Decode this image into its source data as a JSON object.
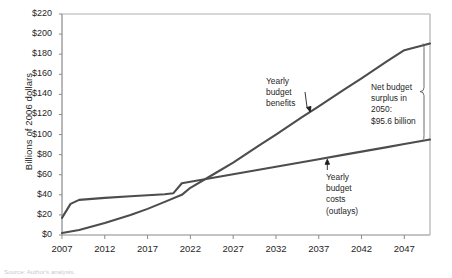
{
  "figure": {
    "source_note": "Source: Author's analysis."
  },
  "chart_data": {
    "type": "line",
    "title": "",
    "xlabel": "",
    "ylabel": "Billions of 2006 dollars",
    "xlim": [
      2007,
      2050
    ],
    "ylim": [
      0,
      220
    ],
    "grid": false,
    "legend": "none (inline annotations)",
    "xticks": [
      "2007",
      "2012",
      "2017",
      "2022",
      "2027",
      "2032",
      "2037",
      "2042",
      "2047"
    ],
    "xtick_values": [
      2007,
      2012,
      2017,
      2022,
      2027,
      2032,
      2037,
      2042,
      2047
    ],
    "yticks": [
      "$0",
      "$20",
      "$40",
      "$60",
      "$80",
      "$100",
      "$120",
      "$140",
      "$160",
      "$180",
      "$200",
      "$220"
    ],
    "ytick_values": [
      0,
      20,
      40,
      60,
      80,
      100,
      120,
      140,
      160,
      180,
      200,
      220
    ],
    "series": [
      {
        "name": "Yearly budget benefits",
        "color": "#4d4d4d",
        "x": [
          2007,
          2009,
          2012,
          2015,
          2017,
          2019,
          2021,
          2022,
          2025,
          2027,
          2030,
          2032,
          2035,
          2037,
          2040,
          2042,
          2045,
          2047,
          2050
        ],
        "values": [
          2.0,
          5.0,
          12.0,
          20.0,
          26.0,
          33.0,
          40.0,
          47.0,
          62.0,
          72.0,
          89.0,
          100.0,
          117.0,
          128.0,
          145.0,
          156.0,
          173.0,
          184.0,
          190.6
        ]
      },
      {
        "name": "Yearly budget costs (outlays)",
        "color": "#4d4d4d",
        "x": [
          2007,
          2008,
          2009,
          2012,
          2015,
          2017,
          2019,
          2020,
          2021,
          2022,
          2025,
          2027,
          2030,
          2032,
          2035,
          2037,
          2040,
          2042,
          2045,
          2047,
          2050
        ],
        "values": [
          17.0,
          31.0,
          35.0,
          37.0,
          38.5,
          39.5,
          40.5,
          41.5,
          51.5,
          53.0,
          57.5,
          60.5,
          65.0,
          68.0,
          72.5,
          75.5,
          80.0,
          83.0,
          87.5,
          90.5,
          95.0
        ]
      }
    ],
    "annotations": [
      {
        "name": "benefits-label",
        "lines": [
          "Yearly",
          "budget",
          "benefits"
        ],
        "points_to_series": "Yearly budget benefits",
        "point_year": 2036
      },
      {
        "name": "costs-label",
        "lines": [
          "Yearly",
          "budget",
          "costs",
          "(outlays)"
        ],
        "points_to_series": "Yearly budget costs (outlays)",
        "point_year": 2038
      },
      {
        "name": "net-surplus-bracket",
        "lines": [
          "Net budget",
          "surplus in",
          "2050:",
          "$95.6 billion"
        ],
        "value": 95.6,
        "year": 2050,
        "bracket_top": 190.6,
        "bracket_bottom": 95.0
      }
    ]
  }
}
